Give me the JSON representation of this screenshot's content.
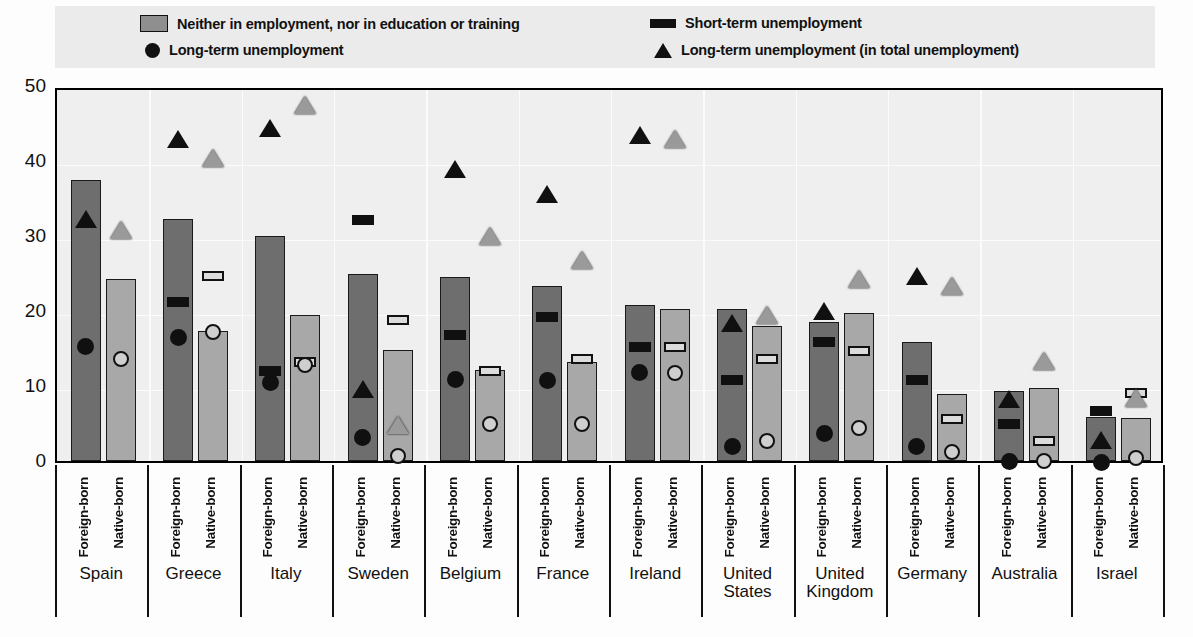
{
  "legend": {
    "items": [
      {
        "key": "neither",
        "label": "Neither in employment, nor in education or training",
        "marker": "gray-square-swatch"
      },
      {
        "key": "short",
        "label": "Short-term unemployment",
        "marker": "black-bar-swatch"
      },
      {
        "key": "long",
        "label": "Long-term unemployment",
        "marker": "black-circle-swatch"
      },
      {
        "key": "long_total",
        "label": "Long-term unemployment (in total unemployment)",
        "marker": "black-triangle-swatch"
      }
    ]
  },
  "axis": {
    "y_ticks": [
      "0",
      "10",
      "20",
      "30",
      "40",
      "50"
    ],
    "group_sublabels": [
      "Foreign-born",
      "Native-born"
    ]
  },
  "chart_data": {
    "type": "bar",
    "title": "",
    "xlabel": "",
    "ylabel": "",
    "ylim": [
      0,
      50
    ],
    "yticks": [
      0,
      10,
      20,
      30,
      40,
      50
    ],
    "grid": true,
    "legend_position": "top",
    "categories": [
      "Spain",
      "Greece",
      "Italy",
      "Sweden",
      "Belgium",
      "France",
      "Ireland",
      "United States",
      "United Kingdom",
      "Germany",
      "Australia",
      "Israel"
    ],
    "subcategories": [
      "Foreign-born",
      "Native-born"
    ],
    "series": [
      {
        "name": "Neither in employment, nor in education or training",
        "type": "bar",
        "foreign_born": [
          37.5,
          32.3,
          30.0,
          25.0,
          24.5,
          23.4,
          20.8,
          20.3,
          18.5,
          15.9,
          9.4,
          5.9
        ],
        "native_born": [
          24.3,
          17.4,
          19.5,
          14.8,
          12.1,
          13.2,
          20.3,
          18.0,
          19.8,
          8.9,
          9.8,
          5.8
        ]
      },
      {
        "name": "Short-term unemployment",
        "type": "marker",
        "foreign_born": [
          null,
          21.8,
          12.5,
          32.7,
          17.4,
          19.8,
          15.8,
          11.4,
          16.4,
          11.3,
          5.5,
          7.2
        ],
        "native_born": [
          null,
          25.2,
          13.8,
          19.3,
          12.6,
          14.2,
          15.8,
          14.2,
          15.2,
          6.2,
          3.2,
          9.6
        ]
      },
      {
        "name": "Long-term unemployment",
        "type": "marker",
        "foreign_born": [
          15.8,
          17.0,
          11.0,
          3.7,
          11.4,
          11.3,
          12.3,
          2.5,
          4.2,
          2.5,
          0.5,
          0.3
        ],
        "native_born": [
          14.2,
          17.8,
          13.3,
          1.2,
          5.5,
          5.5,
          12.3,
          3.2,
          4.9,
          1.7,
          0.6,
          1.0
        ]
      },
      {
        "name": "Long-term unemployment (in total unemployment)",
        "type": "marker",
        "foreign_born": [
          32.8,
          43.5,
          45.0,
          10.2,
          39.5,
          36.2,
          44.0,
          19.0,
          20.6,
          25.2,
          8.8,
          3.3
        ],
        "native_born": [
          31.3,
          41.0,
          48.0,
          5.3,
          30.5,
          27.3,
          43.5,
          20.0,
          24.8,
          23.9,
          13.9,
          8.9
        ]
      }
    ]
  }
}
